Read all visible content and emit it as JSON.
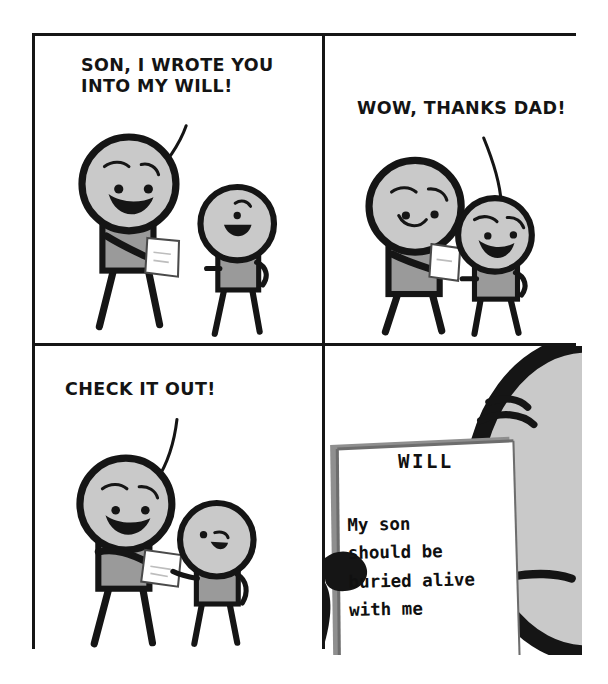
{
  "comic": {
    "title": "Son, I Wrote You Into My Will",
    "background_color": "#ffffff",
    "border_color": "#151515",
    "palette": {
      "ink": "#151515",
      "head_gray": "#c9c9c9",
      "body_gray": "#9a9a9a",
      "paper_white": "#ffffff",
      "paper_shadow": "#8f8f8f"
    },
    "panels": [
      {
        "index": 1,
        "name": "panel-dad-announces",
        "speech": "Son, I wrote you\ninto my will!",
        "speaker": "dad",
        "characters": [
          "dad-holding-paper",
          "son-smiling"
        ]
      },
      {
        "index": 2,
        "name": "panel-son-thanks",
        "speech": "Wow, thanks dad!",
        "speaker": "son",
        "characters": [
          "dad-holding-paper",
          "son-laughing"
        ]
      },
      {
        "index": 3,
        "name": "panel-dad-offers-paper",
        "speech": "Check it out!",
        "speaker": "dad",
        "characters": [
          "dad-handing-paper",
          "son-reaching"
        ]
      },
      {
        "index": 4,
        "name": "panel-will-reveal",
        "speech": "",
        "speaker": "",
        "characters": [
          "son-closeup-worried"
        ],
        "document": {
          "name": "will-document",
          "title": "WILL",
          "body": "My son\nshould be\nburied alive\nwith me"
        }
      }
    ]
  }
}
